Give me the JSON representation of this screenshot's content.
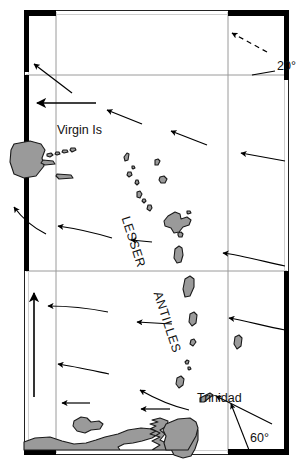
{
  "map": {
    "title": "Lesser Antilles current map",
    "background_color": "#ffffff",
    "land_fill": "#9a9a9a",
    "land_stroke": "#1a1a1a",
    "graticule_color": "#999999",
    "frame_color": "#000000",
    "arrow_color": "#000000",
    "labels": {
      "virgin_is": "Virgin Is",
      "trinidad": "Trinidad",
      "lesser": "LESSER",
      "antilles": "ANTILLES",
      "lat_20": "20°",
      "lon_60": "60°"
    },
    "graticule": {
      "meridians_x": [
        56,
        228
      ],
      "parallels_y": [
        75,
        271
      ],
      "latitude_tick_label": "20°",
      "longitude_tick_label": "60°"
    },
    "frame": {
      "left_x": 24,
      "right_x": 289,
      "top_y": 10,
      "bottom_y": 455,
      "heavy_segments": [
        "top-left",
        "top-right",
        "left-upper",
        "right-upper",
        "bottom-left",
        "bottom-right"
      ]
    },
    "current_arrows": [
      {
        "name": "arrow-ne-dashed",
        "x1": 267,
        "y1": 52,
        "x2": 232,
        "y2": 33,
        "style": "dashed"
      },
      {
        "name": "arrow-nw-upper-left",
        "x1": 72,
        "y1": 93,
        "x2": 33,
        "y2": 63,
        "style": "solid"
      },
      {
        "name": "arrow-w-upper",
        "x1": 96,
        "y1": 103,
        "x2": 36,
        "y2": 103,
        "style": "solid"
      },
      {
        "name": "arrow-nw-mid-a",
        "x1": 142,
        "y1": 122,
        "x2": 106,
        "y2": 110,
        "style": "solid"
      },
      {
        "name": "arrow-nw-mid-b",
        "x1": 206,
        "y1": 143,
        "x2": 170,
        "y2": 130,
        "style": "solid"
      },
      {
        "name": "arrow-w-right-upper",
        "x1": 285,
        "y1": 160,
        "x2": 240,
        "y2": 153,
        "style": "solid"
      },
      {
        "name": "arrow-nw-left-low",
        "x1": 45,
        "y1": 233,
        "x2": 12,
        "y2": 206,
        "style": "solid"
      },
      {
        "name": "arrow-w-left-mid",
        "x1": 110,
        "y1": 237,
        "x2": 56,
        "y2": 226,
        "style": "solid"
      },
      {
        "name": "arrow-w-lesser",
        "x1": 152,
        "y1": 242,
        "x2": 130,
        "y2": 240,
        "style": "solid"
      },
      {
        "name": "arrow-w-right-mid",
        "x1": 285,
        "y1": 265,
        "x2": 222,
        "y2": 253,
        "style": "solid"
      },
      {
        "name": "arrow-n-left-vertical",
        "x1": 34,
        "y1": 397,
        "x2": 34,
        "y2": 292,
        "style": "solid"
      },
      {
        "name": "arrow-w-left-lower",
        "x1": 107,
        "y1": 310,
        "x2": 46,
        "y2": 306,
        "style": "solid"
      },
      {
        "name": "arrow-w-center-lower",
        "x1": 172,
        "y1": 324,
        "x2": 136,
        "y2": 322,
        "style": "solid"
      },
      {
        "name": "arrow-w-right-lower",
        "x1": 285,
        "y1": 329,
        "x2": 227,
        "y2": 318,
        "style": "solid"
      },
      {
        "name": "arrow-nw-lower",
        "x1": 108,
        "y1": 372,
        "x2": 56,
        "y2": 363,
        "style": "solid"
      },
      {
        "name": "arrow-nw-lower-center",
        "x1": 188,
        "y1": 409,
        "x2": 138,
        "y2": 389,
        "style": "solid"
      },
      {
        "name": "arrow-w-lower-left",
        "x1": 90,
        "y1": 403,
        "x2": 61,
        "y2": 403,
        "style": "solid"
      },
      {
        "name": "arrow-w-lower-mid",
        "x1": 170,
        "y1": 409,
        "x2": 140,
        "y2": 409,
        "style": "solid"
      },
      {
        "name": "arrow-nw-trinidad",
        "x1": 272,
        "y1": 424,
        "x2": 215,
        "y2": 395,
        "style": "solid"
      }
    ],
    "leader_lines": [
      {
        "name": "leader-lon-60",
        "x1": 249,
        "y1": 450,
        "x2": 231,
        "y2": 404
      }
    ]
  }
}
